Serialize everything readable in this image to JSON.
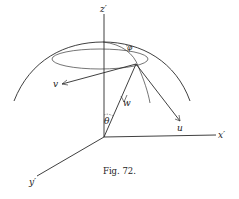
{
  "figure": {
    "caption": "Fig. 72.",
    "labels": {
      "z_axis": "z′",
      "x_axis": "x′",
      "y_axis": "y′",
      "u": "u",
      "v": "v",
      "w": "w",
      "theta": "θ",
      "phi": "φ"
    }
  }
}
